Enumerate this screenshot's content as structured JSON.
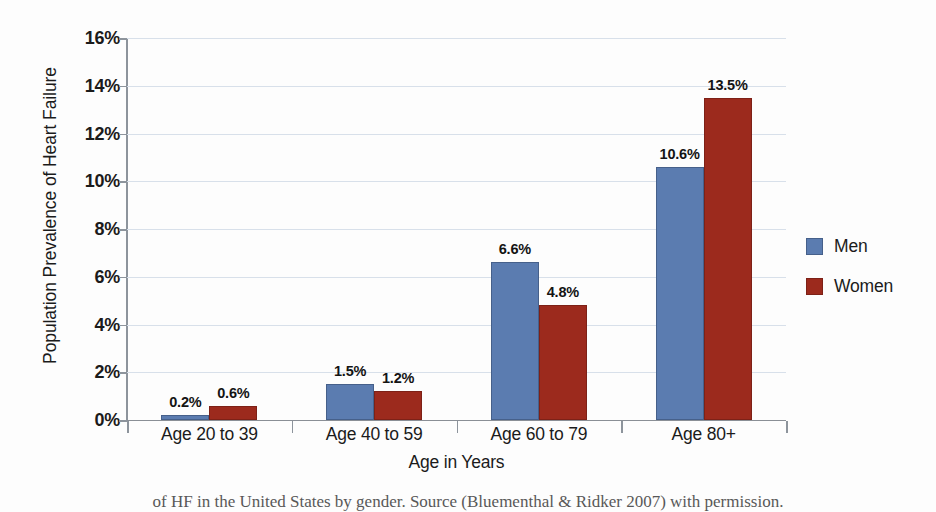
{
  "chart_data": {
    "type": "bar",
    "title": "",
    "xlabel": "Age in Years",
    "ylabel": "Population Prevalence of Heart Failure",
    "categories": [
      "Age 20 to 39",
      "Age 40 to 59",
      "Age 60 to 79",
      "Age 80+"
    ],
    "series": [
      {
        "name": "Men",
        "color": "#5b7cb0",
        "values": [
          0.2,
          1.5,
          6.6,
          10.6
        ],
        "labels": [
          "0.2%",
          "1.5%",
          "6.6%",
          "10.6%"
        ]
      },
      {
        "name": "Women",
        "color": "#9c2a1d",
        "values": [
          0.6,
          1.2,
          4.8,
          13.5
        ],
        "labels": [
          "0.6%",
          "1.2%",
          "4.8%",
          "13.5%"
        ]
      }
    ],
    "ylim": [
      0,
      16
    ],
    "yticks": [
      0,
      2,
      4,
      6,
      8,
      10,
      12,
      14,
      16
    ],
    "ytick_labels": [
      "0%",
      "2%",
      "4%",
      "6%",
      "8%",
      "10%",
      "12%",
      "14%",
      "16%"
    ],
    "grid": true,
    "legend_position": "right",
    "legend_entries": [
      "Men",
      "Women"
    ]
  },
  "caption": {
    "text": "of HF in the United States by gender. Source (Bluementhal & Ridker 2007) with permission."
  }
}
